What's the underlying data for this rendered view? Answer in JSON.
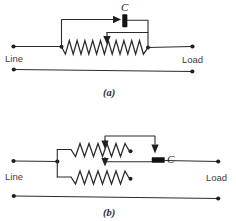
{
  "figure": {
    "background_color": "#ffffff",
    "wire_color": "#2b2b2b",
    "label_color": "#3c3c3c",
    "component_color": "#121212"
  },
  "diagram_a": {
    "caption": "(a)",
    "left_terminal_label": "Line",
    "right_terminal_label": "Load",
    "component_label": "C",
    "component_type": "capacitor-block",
    "resistor_count": 1,
    "resistor_type": "rheostat-with-wiper",
    "zigzag_peaks": 11,
    "wiper_arrows": 2,
    "conductor_lines": 2
  },
  "diagram_b": {
    "caption": "(b)",
    "left_terminal_label": "Line",
    "right_terminal_label": "Load",
    "component_label": "C",
    "component_type": "capacitor-block",
    "resistor_count": 2,
    "resistor_type": "parallel-rheostats-with-wipers",
    "zigzag_peaks": 7,
    "wiper_arrows": 2,
    "conductor_lines": 2
  }
}
